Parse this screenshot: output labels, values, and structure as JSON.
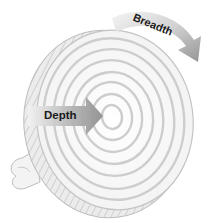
{
  "diagram": {
    "type": "concentric-disc",
    "labels": {
      "depth": "Depth",
      "breadth": "Breadth"
    },
    "rings": 7,
    "colors": {
      "background": "#ffffff",
      "disc_face": "#fbfbfb",
      "ring_stroke": "#cfcfcf",
      "side_band": "#e6e6e6",
      "side_hatch": "#b0b0b0",
      "arrow_fill": "#9a9a9a",
      "arrow_light": "#e8e8e8",
      "text": "#1a1a1a"
    }
  }
}
